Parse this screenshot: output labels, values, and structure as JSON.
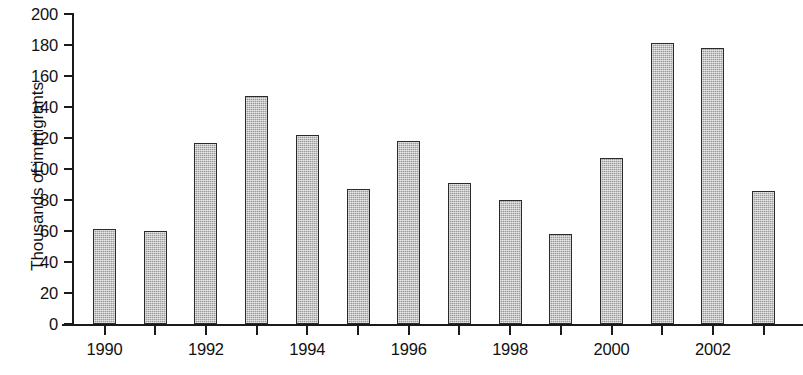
{
  "chart_data": {
    "type": "bar",
    "title": "",
    "xlabel": "",
    "ylabel": "Thousands of immigrants",
    "categories": [
      "1990",
      "1991",
      "1992",
      "1993",
      "1994",
      "1995",
      "1996",
      "1997",
      "1998",
      "1999",
      "2000",
      "2001",
      "2002",
      "2003"
    ],
    "values": [
      61,
      60,
      117,
      147,
      122,
      87,
      118,
      91,
      80,
      58,
      107,
      181,
      178,
      86
    ],
    "ylim": [
      0,
      200
    ],
    "ytick_labels": [
      "200",
      "180",
      "160",
      "140",
      "120",
      "100",
      "80",
      "60",
      "40",
      "20",
      "0"
    ],
    "ytick_values": [
      200,
      180,
      160,
      140,
      120,
      100,
      80,
      60,
      40,
      20,
      0
    ],
    "ytick_step": 20,
    "xtick_labels": [
      "1990",
      "1992",
      "1994",
      "1996",
      "1998",
      "2000",
      "2002"
    ],
    "xtick_label_years": [
      1990,
      1992,
      1994,
      1996,
      1998,
      2000,
      2002
    ],
    "grid": false,
    "legend": null,
    "series": [
      {
        "name": "Immigrants",
        "values": [
          61,
          60,
          117,
          147,
          122,
          87,
          118,
          91,
          80,
          58,
          107,
          181,
          178,
          86
        ]
      }
    ],
    "bar_fill_color": "#9a9a9a",
    "bar_border_color": "#2b2b2b",
    "axis_color": "#1a1a1a",
    "background_color": "#ffffff"
  },
  "figure": {
    "bottom_caption_artifact": ""
  }
}
